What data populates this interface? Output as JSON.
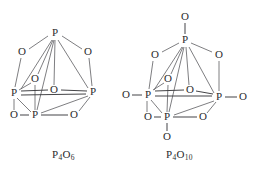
{
  "figure": {
    "kind": "chemical-structure-diagram",
    "background_color": "#ffffff",
    "bond_color": "#5d5d61",
    "atom_label_color": "#2b2b2e"
  },
  "structures": [
    {
      "id": "p4o6",
      "name": "phosphorus-trioxide-cage",
      "formula_element": "P",
      "formula_sub_1": "4",
      "formula_element_2": "O",
      "formula_sub_2": "6",
      "formula_plain": "P4O6",
      "atom_count_p": 4,
      "atom_count_o": 6,
      "atoms": [
        {
          "label": "P",
          "role": "apex-phosphorus",
          "x": 55,
          "y": 33
        },
        {
          "label": "O",
          "role": "bridge-oxygen",
          "x": 22,
          "y": 52
        },
        {
          "label": "O",
          "role": "bridge-oxygen",
          "x": 88,
          "y": 52
        },
        {
          "label": "O",
          "role": "bridge-oxygen-inner",
          "x": 35,
          "y": 79
        },
        {
          "label": "O",
          "role": "bridge-oxygen-inner",
          "x": 54,
          "y": 90
        },
        {
          "label": "P",
          "role": "left-phosphorus",
          "x": 14,
          "y": 93
        },
        {
          "label": "P",
          "role": "right-phosphorus",
          "x": 93,
          "y": 92
        },
        {
          "label": "O",
          "role": "bridge-oxygen-front",
          "x": 14,
          "y": 115
        },
        {
          "label": "P",
          "role": "front-phosphorus",
          "x": 35,
          "y": 115
        },
        {
          "label": "O",
          "role": "bridge-oxygen-front",
          "x": 74,
          "y": 115
        }
      ]
    },
    {
      "id": "p4o10",
      "name": "phosphorus-pentoxide-cage",
      "formula_element": "P",
      "formula_sub_1": "4",
      "formula_element_2": "O",
      "formula_sub_2": "10",
      "formula_plain": "P4O10",
      "atom_count_p": 4,
      "atom_count_o": 10,
      "atoms": [
        {
          "label": "O",
          "role": "terminal-oxygen-top",
          "x": 185,
          "y": 17
        },
        {
          "label": "P",
          "role": "apex-phosphorus",
          "x": 185,
          "y": 40
        },
        {
          "label": "O",
          "role": "bridge-oxygen",
          "x": 155,
          "y": 55
        },
        {
          "label": "O",
          "role": "bridge-oxygen",
          "x": 219,
          "y": 55
        },
        {
          "label": "O",
          "role": "bridge-oxygen-inner",
          "x": 168,
          "y": 79
        },
        {
          "label": "O",
          "role": "bridge-oxygen-inner",
          "x": 190,
          "y": 90
        },
        {
          "label": "O",
          "role": "terminal-oxygen-left",
          "x": 126,
          "y": 95
        },
        {
          "label": "P",
          "role": "left-phosphorus",
          "x": 148,
          "y": 95
        },
        {
          "label": "P",
          "role": "right-phosphorus",
          "x": 219,
          "y": 97
        },
        {
          "label": "O",
          "role": "terminal-oxygen-right",
          "x": 243,
          "y": 97
        },
        {
          "label": "O",
          "role": "bridge-oxygen-front",
          "x": 148,
          "y": 117
        },
        {
          "label": "P",
          "role": "front-phosphorus",
          "x": 167,
          "y": 117
        },
        {
          "label": "O",
          "role": "bridge-oxygen-front",
          "x": 203,
          "y": 117
        },
        {
          "label": "O",
          "role": "terminal-oxygen-bottom",
          "x": 167,
          "y": 137
        }
      ]
    }
  ],
  "labels": {
    "left_formula": "P4O6",
    "right_formula": "P4O10"
  }
}
